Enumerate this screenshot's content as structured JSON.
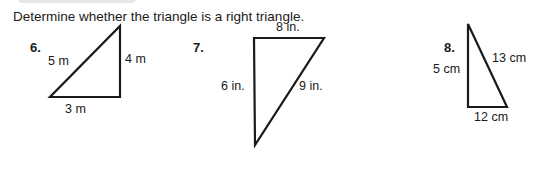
{
  "instruction": "Determine whether the triangle is a right triangle.",
  "problems": [
    {
      "number": "6.",
      "sides": {
        "hypotenuse": "5 m",
        "vertical": "4 m",
        "horizontal": "3 m"
      }
    },
    {
      "number": "7.",
      "sides": {
        "top": "8 in.",
        "left": "6 in.",
        "diagonal": "9 in."
      }
    },
    {
      "number": "8.",
      "sides": {
        "left": "5 cm",
        "diagonal": "13 cm",
        "bottom": "12 cm"
      }
    }
  ]
}
